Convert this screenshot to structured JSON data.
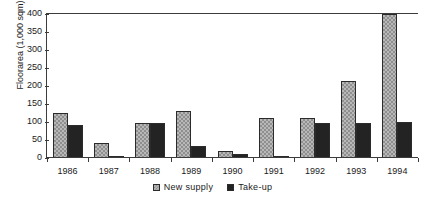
{
  "chart_data": {
    "type": "bar",
    "title": "",
    "xlabel": "",
    "ylabel": "Floorarea (1,000 sqm)",
    "categories": [
      "1986",
      "1987",
      "1988",
      "1989",
      "1990",
      "1991",
      "1992",
      "1993",
      "1994"
    ],
    "series": [
      {
        "name": "New supply",
        "color": "#b8b8b8",
        "pattern": "checkered",
        "values": [
          125,
          43,
          96,
          131,
          20,
          110,
          110,
          213,
          400
        ]
      },
      {
        "name": "Take-up",
        "color": "#232323",
        "pattern": "solid",
        "values": [
          92,
          6,
          96,
          33,
          10,
          5,
          97,
          97,
          100
        ]
      }
    ],
    "ylim": [
      0,
      400
    ],
    "yticks": [
      0,
      50,
      100,
      150,
      200,
      250,
      300,
      350,
      400
    ],
    "ytick_labels": [
      "0",
      "50",
      "100",
      "150",
      "200",
      "250",
      "300",
      "350",
      "400"
    ],
    "grid": false,
    "legend_position": "bottom"
  },
  "legend": {
    "items": [
      {
        "label": "New supply"
      },
      {
        "label": "Take-up"
      }
    ]
  }
}
